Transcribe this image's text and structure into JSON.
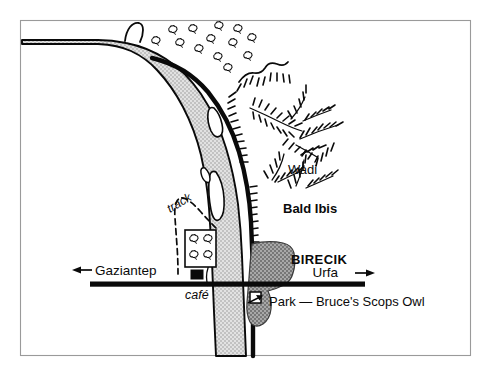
{
  "map": {
    "title": "Birecik area sketch map",
    "frame": {
      "color": "#9a9a9a"
    },
    "colors": {
      "river_fill": "#d6d6d6",
      "town_fill": "#8f8f8f",
      "ink": "#0a0a0a",
      "paper": "#ffffff",
      "frame": "#9a9a9a"
    },
    "labels": {
      "wadi": "Wadi",
      "bald_ibis": "Bald Ibis",
      "birecik": "BIRECIK",
      "gaziantep": "Gaziantep",
      "urfa": "Urfa",
      "cafe": "café",
      "track": "track",
      "park": "Park — Bruce's Scops Owl"
    },
    "features": {
      "river_name": "Euphrates river",
      "road_name": "Gaziantep – Urfa highway",
      "orchard": "tree plantation enclosure",
      "cafe_building": "café building",
      "park_marker": "park enclosure",
      "tree_symbol_count": 13,
      "orchard_tree_count": 4
    },
    "icons": {
      "arrow_west": "◀",
      "arrow_east": "▶"
    }
  }
}
